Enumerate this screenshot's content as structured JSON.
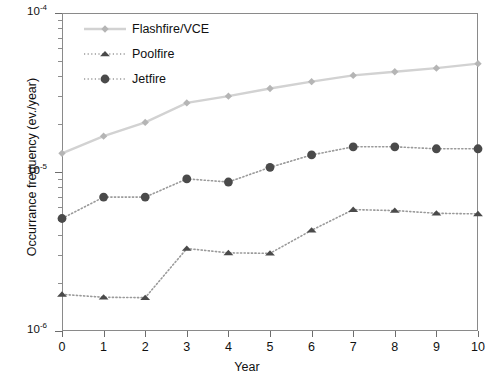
{
  "chart_data": {
    "type": "line",
    "title": "",
    "xlabel": "Year",
    "ylabel": "Occurrance frequency (ev./year)",
    "xlim": [
      0,
      10
    ],
    "ylim": [
      1e-06,
      0.0001
    ],
    "yscale": "log",
    "xscale": "linear",
    "grid": false,
    "legend_position": "top-left inside",
    "x": [
      0,
      1,
      2,
      3,
      4,
      5,
      6,
      7,
      8,
      9,
      10
    ],
    "xtick_labels": [
      "0",
      "1",
      "2",
      "3",
      "4",
      "5",
      "6",
      "7",
      "8",
      "9",
      "10"
    ],
    "ytick_labels": [
      "10-6",
      "10-5",
      "10-4"
    ],
    "ytick_values": [
      1e-06,
      1e-05,
      0.0001
    ],
    "series": [
      {
        "name": "Flashfire/VCE",
        "marker": "diamond",
        "line_style": "solid",
        "color": "#d2d2d2",
        "marker_color": "#b5b5b5",
        "values": [
          1.31e-05,
          1.68e-05,
          2.05e-05,
          2.72e-05,
          3e-05,
          3.35e-05,
          3.7e-05,
          4.05e-05,
          4.27e-05,
          4.5e-05,
          4.8e-05
        ]
      },
      {
        "name": "Poolfire",
        "marker": "triangle",
        "line_style": "dotted",
        "color": "#9a9a9a",
        "marker_color": "#4a4a4a",
        "values": [
          1.7e-06,
          1.63e-06,
          1.62e-06,
          3.3e-06,
          3.1e-06,
          3.08e-06,
          4.3e-06,
          5.8e-06,
          5.72e-06,
          5.5e-06,
          5.45e-06
        ]
      },
      {
        "name": "Jetfire",
        "marker": "circle",
        "line_style": "dotted",
        "color": "#9a9a9a",
        "marker_color": "#4a4a4a",
        "values": [
          5.1e-06,
          6.95e-06,
          6.95e-06,
          9.05e-06,
          8.65e-06,
          1.07e-05,
          1.28e-05,
          1.44e-05,
          1.44e-05,
          1.4e-05,
          1.4e-05
        ]
      }
    ]
  },
  "axes": {
    "y_title": "Occurrance frequency (ev./year)",
    "x_title": "Year",
    "y_labels": [
      {
        "mantissa": "10",
        "exponent": "-4",
        "value": 0.0001
      },
      {
        "mantissa": "10",
        "exponent": "-5",
        "value": 1e-05
      },
      {
        "mantissa": "10",
        "exponent": "-6",
        "value": 1e-06
      }
    ],
    "x_labels": [
      "0",
      "1",
      "2",
      "3",
      "4",
      "5",
      "6",
      "7",
      "8",
      "9",
      "10"
    ]
  },
  "legend": {
    "items": [
      {
        "label": "Flashfire/VCE",
        "marker": "diamond",
        "color": "#b5b5b5",
        "line": "#d2d2d2"
      },
      {
        "label": "Poolfire",
        "marker": "triangle",
        "color": "#4a4a4a",
        "line": "#9a9a9a"
      },
      {
        "label": "Jetfire",
        "marker": "circle",
        "color": "#4a4a4a",
        "line": "#9a9a9a"
      }
    ]
  }
}
